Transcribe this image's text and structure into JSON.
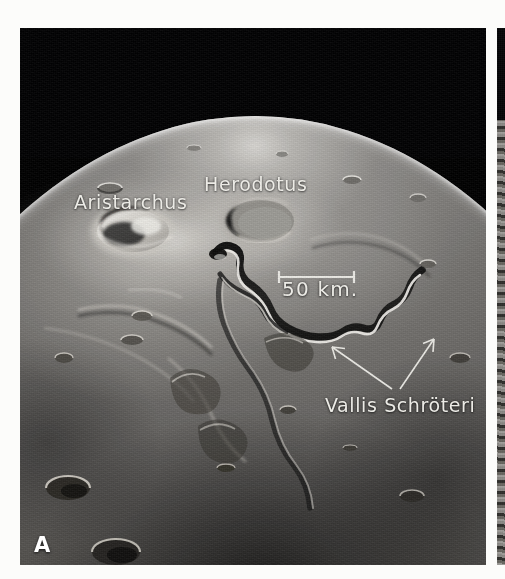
{
  "figure": {
    "domain_description": "Apollo orbital photograph of the Aristarchus Plateau, Moon",
    "background_color": "#fcfcfa",
    "panels": [
      {
        "id": "A",
        "letter": "A",
        "letter_color": "#ffffff",
        "sky_color": "#020203"
      },
      {
        "id": "B",
        "letter": "B",
        "cropped": "true"
      }
    ]
  },
  "panel_a": {
    "letter": "A",
    "annotation_color": "#ecebe6",
    "labels": [
      {
        "name": "aristarchus",
        "text": "Aristarchus",
        "x": 54,
        "y": 163
      },
      {
        "name": "herodotus",
        "text": "Herodotus",
        "x": 184,
        "y": 145
      },
      {
        "name": "vallis-schroeteri",
        "text": "Vallis Schröteri",
        "x": 305,
        "y": 366
      }
    ],
    "scale_bar": {
      "text": "50 km.",
      "length_km": 50,
      "bar_x1": 259,
      "bar_x2": 334,
      "bar_y": 249,
      "label_x": 262,
      "label_y": 249,
      "color": "#ecebe6"
    },
    "leader_arrows": [
      {
        "name": "arrow-to-rille-west",
        "from_x": 372,
        "from_y": 361,
        "to_x": 310,
        "to_y": 318
      },
      {
        "name": "arrow-to-rille-east",
        "from_x": 380,
        "from_y": 361,
        "to_x": 414,
        "to_y": 310
      }
    ],
    "features": {
      "aristarchus_crater": {
        "cx": 113,
        "cy": 203,
        "rx": 38,
        "ry": 22
      },
      "herodotus_crater": {
        "cx": 240,
        "cy": 193,
        "rx": 37,
        "ry": 24
      },
      "vallis_schroeteri": "sinuous rille running from Cobra Head east of Herodotus southeast then east"
    }
  }
}
